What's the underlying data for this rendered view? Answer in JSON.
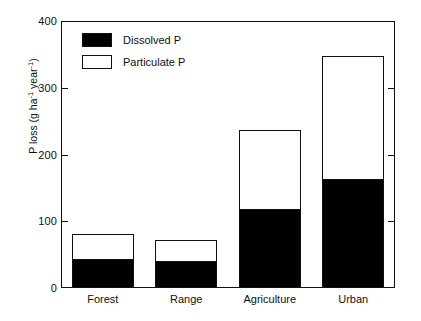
{
  "chart_data": {
    "type": "bar",
    "subtype": "stacked-bar",
    "title": "",
    "xlabel": "",
    "ylabel": "P loss (g ha⁻¹ year⁻¹)",
    "ylabel_parts": {
      "prefix": "P loss (g ha",
      "sup1": "-1",
      "middle": " year",
      "sup2": "-1",
      "suffix": ")"
    },
    "categories": [
      "Forest",
      "Range",
      "Agriculture",
      "Urban"
    ],
    "series": [
      {
        "name": "Dissolved P",
        "values": [
          43,
          40,
          118,
          163
        ],
        "color": "#000000",
        "fill": "solid"
      },
      {
        "name": "Particulate P",
        "values": [
          38,
          32,
          118,
          185
        ],
        "color": "#ffffff",
        "fill": "open"
      }
    ],
    "totals": [
      81,
      72,
      236,
      348
    ],
    "ylim": [
      0,
      400
    ],
    "yticks": [
      0,
      100,
      200,
      300,
      400
    ],
    "ytick_labels": [
      "0",
      "100",
      "200",
      "300",
      "400"
    ],
    "grid": false,
    "legend_position": "top-left",
    "legend_entries": [
      "Dissolved P",
      "Particulate P"
    ],
    "axis_color": "#111111",
    "background": "#ffffff"
  }
}
